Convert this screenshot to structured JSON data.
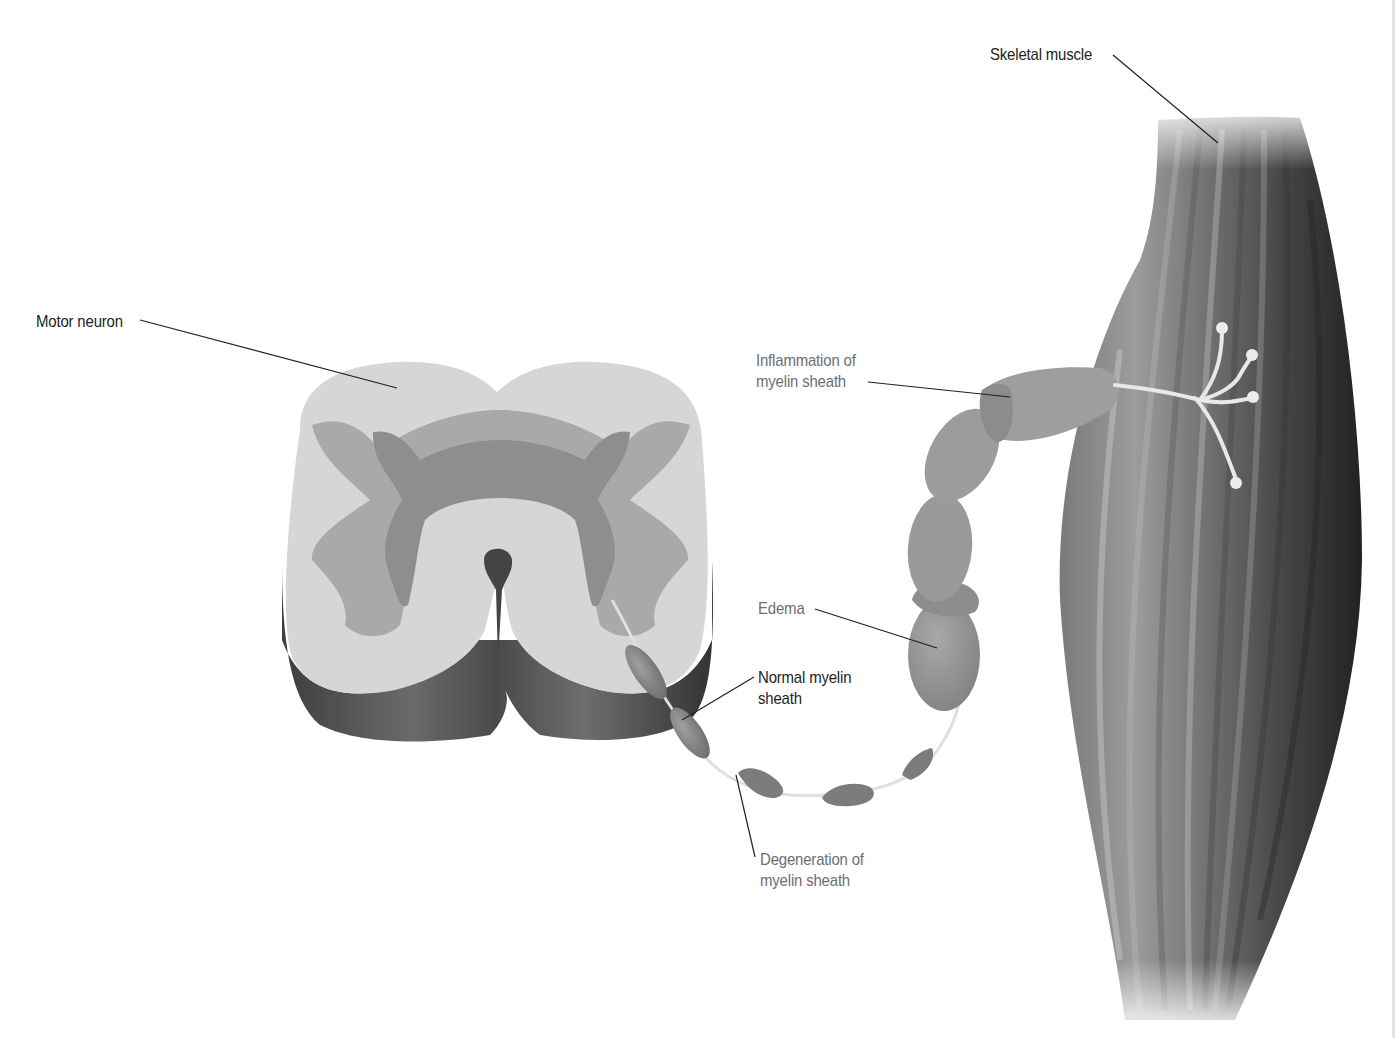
{
  "figure": {
    "labels": {
      "skeletal_muscle": "Skeletal muscle",
      "motor_neuron": "Motor neuron",
      "inflammation": "Inflammation of\nmyelin sheath",
      "edema": "Edema",
      "normal_myelin": "Normal myelin\nsheath",
      "degeneration": "Degeneration of\nmyelin sheath"
    },
    "colors": {
      "white_matter": "#d9d9d9",
      "gray_matter_outer": "#a8a8a8",
      "gray_matter_inner": "#8f8f8f",
      "cord_side": "#5a5a5a",
      "myelin": "#8a8a8a",
      "muscle_dark": "#3a3a3a",
      "muscle_light": "#9a9a9a",
      "axon": "#e6e6e6",
      "label_dark": "#231f20",
      "label_gray": "#6d6e70",
      "leader_line": "#231f20"
    }
  }
}
